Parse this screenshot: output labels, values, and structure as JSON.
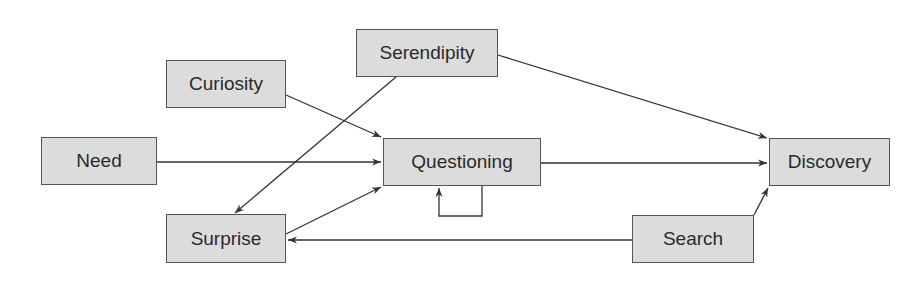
{
  "diagram": {
    "colors": {
      "node_fill": "#dcdcdc",
      "node_border": "#555555",
      "edge": "#333333",
      "text": "#2a2a2a"
    },
    "nodes": [
      {
        "id": "serendipity",
        "label": "Serendipity",
        "x": 356,
        "y": 29,
        "w": 142,
        "h": 48
      },
      {
        "id": "curiosity",
        "label": "Curiosity",
        "x": 166,
        "y": 60,
        "w": 120,
        "h": 48
      },
      {
        "id": "need",
        "label": "Need",
        "x": 41,
        "y": 137,
        "w": 116,
        "h": 48
      },
      {
        "id": "questioning",
        "label": "Questioning",
        "x": 383,
        "y": 138,
        "w": 158,
        "h": 48
      },
      {
        "id": "discovery",
        "label": "Discovery",
        "x": 769,
        "y": 138,
        "w": 121,
        "h": 48
      },
      {
        "id": "surprise",
        "label": "Surprise",
        "x": 166,
        "y": 214,
        "w": 120,
        "h": 49
      },
      {
        "id": "search",
        "label": "Search",
        "x": 632,
        "y": 215,
        "w": 122,
        "h": 48
      }
    ],
    "edges": [
      {
        "from": "curiosity",
        "to": "questioning"
      },
      {
        "from": "need",
        "to": "questioning"
      },
      {
        "from": "surprise",
        "to": "questioning"
      },
      {
        "from": "serendipity",
        "to": "surprise"
      },
      {
        "from": "serendipity",
        "to": "discovery"
      },
      {
        "from": "questioning",
        "to": "discovery"
      },
      {
        "from": "search",
        "to": "discovery"
      },
      {
        "from": "search",
        "to": "surprise"
      },
      {
        "from": "questioning",
        "to": "questioning",
        "type": "self-loop"
      }
    ]
  }
}
